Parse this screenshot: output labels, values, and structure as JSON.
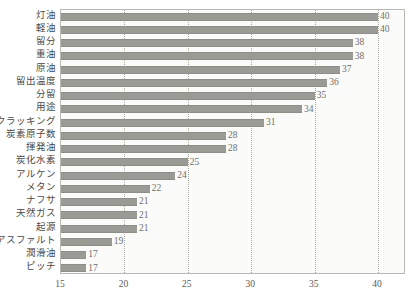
{
  "chart_data": {
    "type": "bar",
    "orientation": "horizontal",
    "title": "",
    "subtitle": "",
    "xlabel": "",
    "ylabel": "",
    "xlim": [
      15,
      42.2
    ],
    "xticks": [
      15,
      20,
      25,
      30,
      35,
      40
    ],
    "xtick_labels": [
      "15",
      "20",
      "25",
      "30",
      "35",
      "40"
    ],
    "grid": true,
    "grid_axis": "x",
    "grid_style": "dotted",
    "legend": null,
    "legend_position": "none",
    "bar_color": "#9b9b96",
    "value_labels_shown": true,
    "categories": [
      "灯油",
      "軽油",
      "留分",
      "重油",
      "原油",
      "留出温度",
      "分留",
      "用途",
      "クラッキング",
      "炭素原子数",
      "揮発油",
      "炭化水素",
      "アルケン",
      "メタン",
      "ナフサ",
      "天然ガス",
      "起源",
      "アスファルト",
      "潤滑油",
      "ピッチ"
    ],
    "values": [
      40,
      40,
      38,
      38,
      37,
      36,
      35,
      34,
      31,
      28,
      28,
      25,
      24,
      22,
      21,
      21,
      21,
      19,
      17,
      17
    ],
    "value_label_texts": [
      "40",
      "40",
      "38",
      "38",
      "37",
      "36",
      "35",
      "34",
      "31",
      "28",
      "28",
      "25",
      "24",
      "22",
      "21",
      "21",
      "21",
      "19",
      "17",
      "17"
    ]
  },
  "frame": {
    "border_color": "#b9b9b4",
    "background_color": "#fbfbf9"
  }
}
